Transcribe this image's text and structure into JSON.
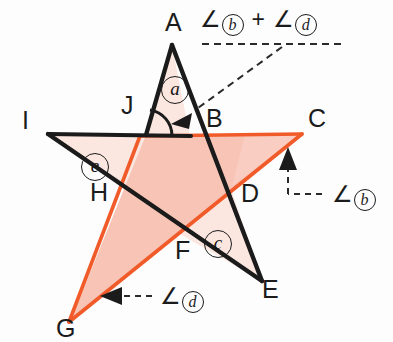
{
  "figure": {
    "type": "geometry-diagram",
    "colors": {
      "black_stroke": "#1b1b1b",
      "orange_stroke": "#f15a29",
      "orange_fill": "#f7c1b2",
      "pale_fill": "#fbe7e0",
      "background": "#fdfdfd"
    }
  },
  "vertices": [
    {
      "label": "A",
      "x": 172,
      "y": 22
    },
    {
      "label": "B",
      "x": 210,
      "y": 110
    },
    {
      "label": "C",
      "x": 310,
      "y": 111
    },
    {
      "label": "D",
      "x": 243,
      "y": 186
    },
    {
      "label": "E",
      "x": 264,
      "y": 280
    },
    {
      "label": "F",
      "x": 178,
      "y": 241
    },
    {
      "label": "G",
      "x": 58,
      "y": 319
    },
    {
      "label": "H",
      "x": 92,
      "y": 182
    },
    {
      "label": "I",
      "x": 23,
      "y": 112
    },
    {
      "label": "J",
      "x": 124,
      "y": 97
    }
  ],
  "angle_markers": [
    {
      "label": "a",
      "x": 163,
      "y": 78
    },
    {
      "label": "e",
      "x": 84,
      "y": 155
    },
    {
      "label": "c",
      "x": 207,
      "y": 232
    }
  ],
  "annotations": [
    {
      "name": "sum-annotation",
      "text_parts": [
        "∠",
        "b",
        "+",
        "∠",
        "d"
      ],
      "x": 200,
      "y": 8,
      "pointer": "dashed-line-to-angle-a-arrow"
    },
    {
      "name": "angle-b-annotation",
      "text_parts": [
        "∠",
        "b"
      ],
      "x": 332,
      "y": 183,
      "pointer": "dashed-line-up-arrow-to-C"
    },
    {
      "name": "angle-d-annotation",
      "text_parts": [
        "∠",
        "d"
      ],
      "x": 160,
      "y": 285,
      "pointer": "dashed-line-left-arrow-to-G"
    }
  ],
  "symbols": {
    "angle_sign": "∠",
    "plus_sign": "+"
  }
}
